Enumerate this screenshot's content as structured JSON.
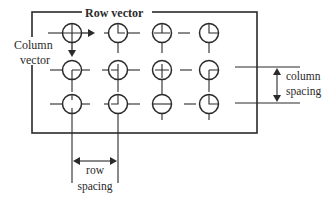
{
  "diagram": {
    "labels": {
      "row_vector": "Row vector",
      "column_vector_line1": "Column",
      "column_vector_line2": "vector",
      "column_spacing_line1": "column",
      "column_spacing_line2": "spacing",
      "row_spacing_line1": "row",
      "row_spacing_line2": "spacing"
    },
    "frame": {
      "x": 32,
      "y": 12,
      "width": 225,
      "height": 121
    },
    "grid": {
      "columns_x": [
        72,
        118,
        162,
        209
      ],
      "rows_y": [
        33,
        70,
        104
      ],
      "radius": 9.5
    },
    "elements": [
      {
        "row": 0,
        "col": 0,
        "hand": "cross"
      },
      {
        "row": 0,
        "col": 1,
        "hand": "up-right"
      },
      {
        "row": 0,
        "col": 2,
        "hand": "up-left-right"
      },
      {
        "row": 0,
        "col": 3,
        "hand": "up-right-long"
      },
      {
        "row": 1,
        "col": 0,
        "hand": "down-right"
      },
      {
        "row": 1,
        "col": 1,
        "hand": "down-left"
      },
      {
        "row": 1,
        "col": 2,
        "hand": "cross-small"
      },
      {
        "row": 1,
        "col": 3,
        "hand": "down-right-long"
      },
      {
        "row": 2,
        "col": 0,
        "hand": "up-down"
      },
      {
        "row": 2,
        "col": 1,
        "hand": "up-left"
      },
      {
        "row": 2,
        "col": 2,
        "hand": "horizontal"
      },
      {
        "row": 2,
        "col": 3,
        "hand": "up-right-short"
      }
    ],
    "colors": {
      "stroke": "#2a2a2a",
      "background": "#ffffff"
    }
  }
}
